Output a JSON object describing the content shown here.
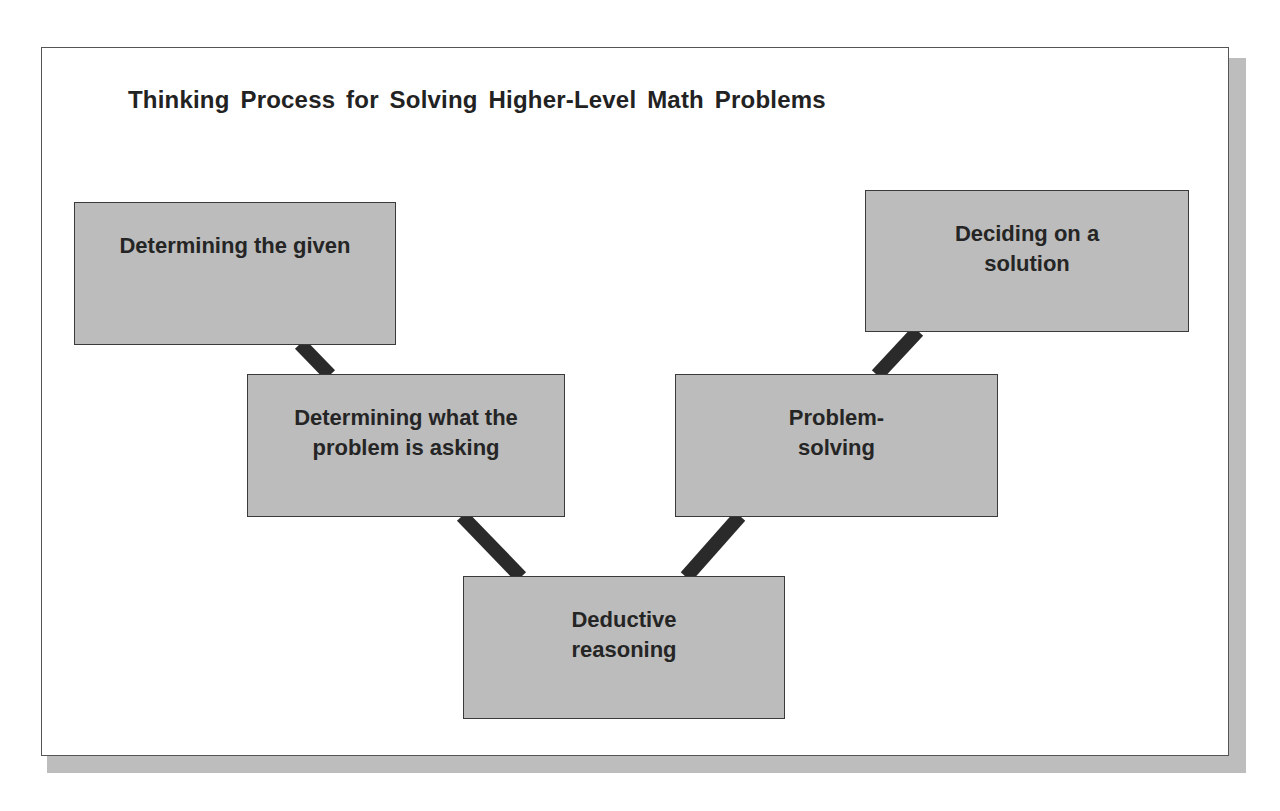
{
  "diagram": {
    "title": "Thinking Process for Solving Higher-Level Math Problems",
    "colors": {
      "box_fill": "#bcbcbc",
      "box_border": "#3a3a3a",
      "connector": "#2a2a2a",
      "text": "#252525",
      "shadow": "#bdbdbd"
    },
    "nodes": [
      {
        "id": "given",
        "label": "Determining the given"
      },
      {
        "id": "asking",
        "label": "Determining what the problem is asking"
      },
      {
        "id": "deductive",
        "label": "Deductive reasoning"
      },
      {
        "id": "problem-solving",
        "label": "Problem-solving"
      },
      {
        "id": "solution",
        "label": "Deciding on a solution"
      }
    ],
    "edges": [
      {
        "from": "given",
        "to": "asking"
      },
      {
        "from": "asking",
        "to": "deductive"
      },
      {
        "from": "deductive",
        "to": "problem-solving"
      },
      {
        "from": "problem-solving",
        "to": "solution"
      }
    ]
  }
}
